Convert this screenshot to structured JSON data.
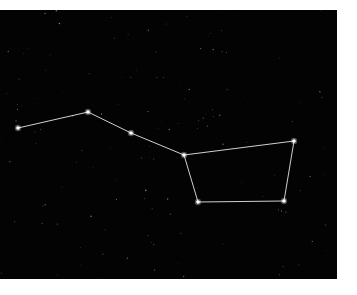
{
  "image": {
    "subject": "Big Dipper constellation star chart",
    "background_color": "#030303",
    "line_color": "#e6e6e6",
    "star_color": "#ffffff"
  },
  "constellation": {
    "name": "Big Dipper",
    "stars": [
      {
        "x": 18,
        "y": 118
      },
      {
        "x": 88,
        "y": 102
      },
      {
        "x": 131,
        "y": 123
      },
      {
        "x": 184,
        "y": 145
      },
      {
        "x": 294,
        "y": 131
      },
      {
        "x": 284,
        "y": 191
      },
      {
        "x": 198,
        "y": 192
      }
    ],
    "edges": [
      [
        0,
        1
      ],
      [
        1,
        2
      ],
      [
        2,
        3
      ],
      [
        3,
        4
      ],
      [
        4,
        5
      ],
      [
        5,
        6
      ],
      [
        6,
        3
      ]
    ]
  }
}
